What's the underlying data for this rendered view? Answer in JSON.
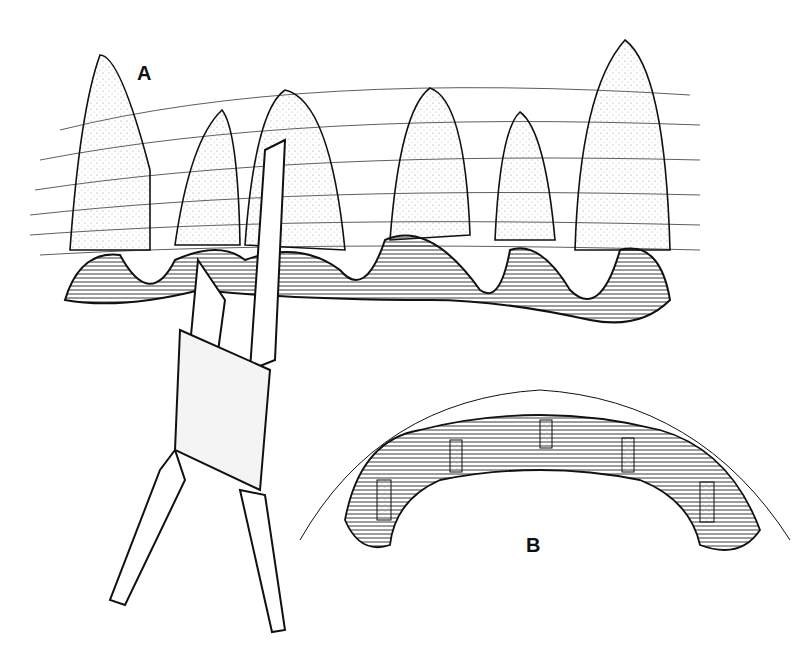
{
  "figure": {
    "panel_a_label": "A",
    "panel_b_label": "B",
    "colors": {
      "ink": "#111111",
      "stipple": "#cfcfcf",
      "paper": "#ffffff"
    }
  }
}
